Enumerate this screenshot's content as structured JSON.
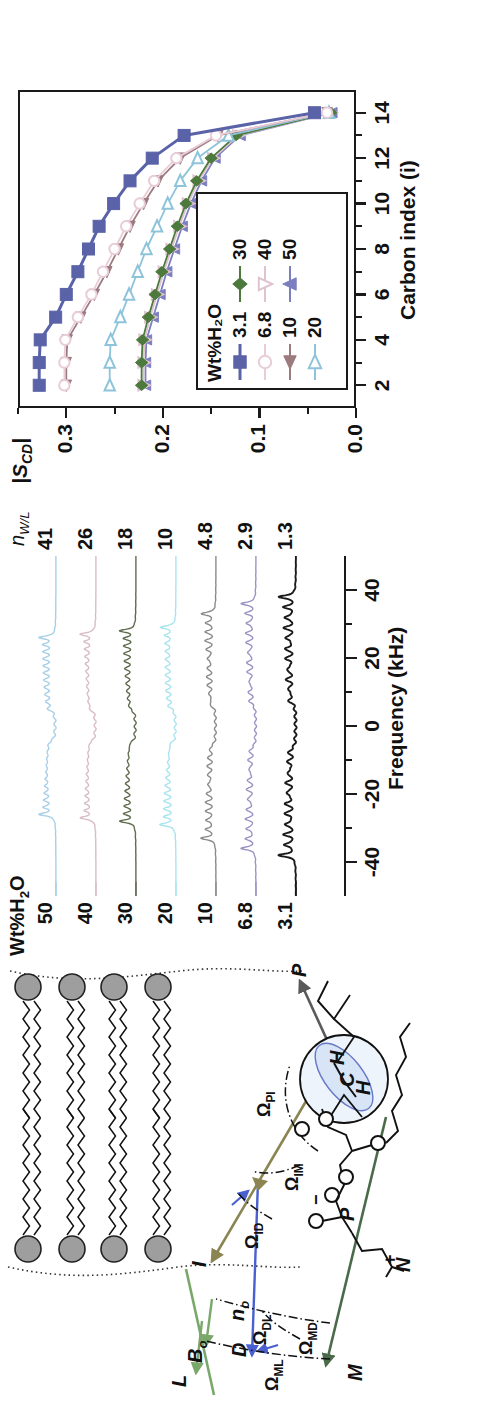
{
  "figure": {
    "panels": [
      "diagram",
      "spectra",
      "order-parameter"
    ]
  },
  "diagram": {
    "vectors": [
      {
        "name": "M",
        "label": "M",
        "color": "#4a6b4a",
        "desc": "molecular frame"
      },
      {
        "name": "D",
        "label": "D",
        "color": "#4a5fd0",
        "desc": "director frame"
      },
      {
        "name": "L",
        "label": "L",
        "color": "#7aa86b",
        "desc": "laboratory frame"
      },
      {
        "name": "I",
        "label": "I",
        "color": "#8a8552",
        "desc": "internal frame"
      },
      {
        "name": "P",
        "label": "P",
        "color": "#5a5a5a",
        "desc": "principal frame"
      },
      {
        "name": "B0",
        "label": "B",
        "sub": "o",
        "color": "#7aa86b",
        "desc": "magnetic field"
      }
    ],
    "normal_label": {
      "base": "n",
      "sub": "o"
    },
    "angles": [
      {
        "name": "omega-ml",
        "omega": "Ω",
        "sub": "ML"
      },
      {
        "name": "omega-dl",
        "omega": "Ω",
        "sub": "DL"
      },
      {
        "name": "omega-md",
        "omega": "Ω",
        "sub": "MD"
      },
      {
        "name": "omega-id",
        "omega": "Ω",
        "sub": "ID"
      },
      {
        "name": "omega-im",
        "omega": "Ω",
        "sub": "IM"
      },
      {
        "name": "omega-pi",
        "omega": "Ω",
        "sub": "PI"
      }
    ],
    "molecule": {
      "atoms": [
        "N",
        "P",
        "O",
        "O",
        "O",
        "O",
        "O",
        "O",
        "C",
        "H",
        "H"
      ],
      "charges": [
        "+",
        "−"
      ],
      "ch2_labels": [
        "H",
        "C",
        "H"
      ]
    },
    "bilayer": {
      "headgroup_count_top": 4,
      "headgroup_count_bottom": 4,
      "headgroup_color": "#9e9e9e"
    }
  },
  "spectra": {
    "xlabel": "Frequency (kHz)",
    "xticks": [
      -40,
      -20,
      0,
      20,
      40
    ],
    "xlim": [
      -50,
      50
    ],
    "left_header": "Wt%H₂O",
    "right_header": "n",
    "right_header_sub": "W/L",
    "traces": [
      {
        "wt": "50",
        "nwl": "41",
        "color": "#a8cfe8"
      },
      {
        "wt": "40",
        "nwl": "26",
        "color": "#d8bcc8"
      },
      {
        "wt": "30",
        "nwl": "18",
        "color": "#5f6b4e"
      },
      {
        "wt": "20",
        "nwl": "10",
        "color": "#a8e4ef"
      },
      {
        "wt": "10",
        "nwl": "4.8",
        "color": "#8a8a8a"
      },
      {
        "wt": "6.8",
        "nwl": "2.9",
        "color": "#9a93c4"
      },
      {
        "wt": "3.1",
        "nwl": "1.3",
        "color": "#1a1a1a"
      }
    ]
  },
  "chart_data": {
    "type": "line",
    "title": "",
    "xlabel": "Carbon index (i)",
    "ylabel": "|S_CD|",
    "ylabel_base": "|S",
    "ylabel_sub": "CD",
    "ylabel_tail": "|",
    "xlim": [
      1,
      15
    ],
    "ylim": [
      0.0,
      0.35
    ],
    "xticks": [
      2,
      4,
      6,
      8,
      10,
      12,
      14
    ],
    "xminor": [
      3,
      5,
      7,
      9,
      11,
      13
    ],
    "yticks": [
      "0.0",
      "0.1",
      "0.2",
      "0.3"
    ],
    "ytickvals": [
      0.0,
      0.1,
      0.2,
      0.3
    ],
    "yminor": [
      0.05,
      0.15,
      0.25,
      0.35
    ],
    "legend_title": "Wt%H₂O",
    "legend_position": "lower-left-inside",
    "x": [
      2,
      3,
      4,
      5,
      6,
      7,
      8,
      9,
      10,
      11,
      12,
      13,
      14
    ],
    "series": [
      {
        "name": "3.1",
        "marker": "square-filled",
        "color": "#5a62a8",
        "values": [
          0.328,
          0.328,
          0.327,
          0.311,
          0.3,
          0.288,
          0.277,
          0.266,
          0.251,
          0.234,
          0.211,
          0.178,
          0.043
        ]
      },
      {
        "name": "6.8",
        "marker": "circle-open",
        "color": "#e8ccd8",
        "values": [
          0.302,
          0.302,
          0.301,
          0.288,
          0.274,
          0.262,
          0.25,
          0.238,
          0.224,
          0.209,
          0.186,
          0.145,
          0.03
        ]
      },
      {
        "name": "10",
        "marker": "triangle-left-filled",
        "color": "#9c7b7f",
        "values": [
          0.3,
          0.3,
          0.299,
          0.285,
          0.271,
          0.258,
          0.246,
          0.234,
          0.22,
          0.205,
          0.182,
          0.143,
          0.03
        ]
      },
      {
        "name": "20",
        "marker": "triangle-right-open",
        "color": "#8ec4da",
        "values": [
          0.255,
          0.255,
          0.254,
          0.244,
          0.235,
          0.226,
          0.217,
          0.206,
          0.195,
          0.182,
          0.164,
          0.132,
          0.028
        ]
      },
      {
        "name": "30",
        "marker": "diamond-filled",
        "color": "#4c7a3c",
        "values": [
          0.222,
          0.222,
          0.221,
          0.215,
          0.208,
          0.201,
          0.193,
          0.185,
          0.176,
          0.165,
          0.15,
          0.124,
          0.026
        ]
      },
      {
        "name": "40",
        "marker": "triangle-down-open",
        "color": "#e0c3cf",
        "values": [
          0.22,
          0.22,
          0.219,
          0.213,
          0.206,
          0.199,
          0.191,
          0.183,
          0.174,
          0.163,
          0.148,
          0.122,
          0.026
        ]
      },
      {
        "name": "50",
        "marker": "triangle-up-filled",
        "color": "#7b7fc0",
        "values": [
          0.218,
          0.218,
          0.217,
          0.21,
          0.203,
          0.196,
          0.188,
          0.18,
          0.171,
          0.16,
          0.146,
          0.12,
          0.025
        ]
      }
    ]
  }
}
